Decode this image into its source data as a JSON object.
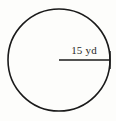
{
  "figure": {
    "kind": "circle-with-radius-diagram",
    "background_color": "#fdfdfb",
    "stroke_color": "#1a1a1a",
    "text_color": "#2a2a2a",
    "circle": {
      "center_x": 59,
      "center_y": 60,
      "radius_px": 51,
      "stroke_width": 1.6
    },
    "radius_segment": {
      "from_x": 59,
      "from_y": 60,
      "to_x": 110,
      "to_y": 60,
      "stroke_width": 1.6,
      "end_tick": true
    },
    "measurement": {
      "label": "15 yd",
      "value": 15,
      "unit": "yd",
      "quantity": "radius"
    }
  }
}
